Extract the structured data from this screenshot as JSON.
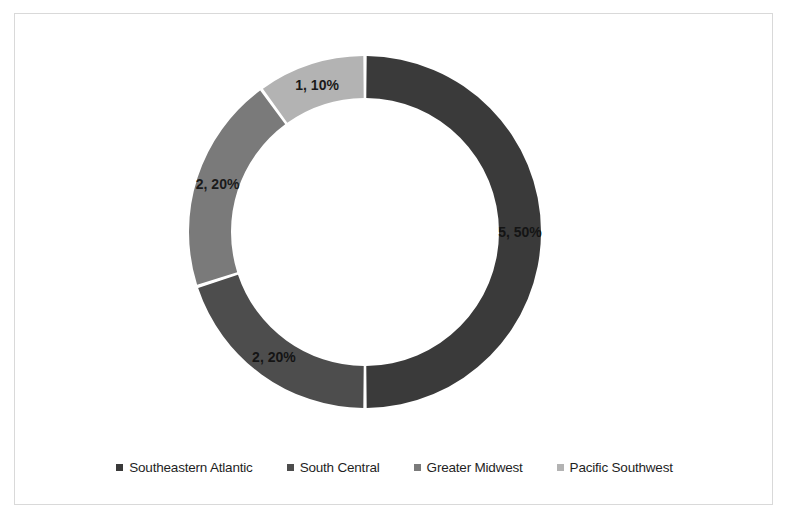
{
  "chart_data": {
    "type": "pie",
    "variant": "doughnut",
    "title": "",
    "subtitle": "",
    "xlabel": "",
    "ylabel": "",
    "grid": false,
    "legend_position": "bottom",
    "start_angle_deg": 0,
    "direction": "clockwise",
    "total_value": 10,
    "categories": [
      "Southeastern Atlantic",
      "South Central",
      "Greater Midwest",
      "Pacific Southwest"
    ],
    "values": [
      5,
      2,
      2,
      1
    ],
    "percentages": [
      50,
      20,
      20,
      10
    ],
    "data_labels": [
      "5, 50%",
      "2, 20%",
      "2, 20%",
      "1, 10%"
    ],
    "colors": [
      "#3a3a3a",
      "#4d4d4d",
      "#7a7a7a",
      "#b3b3b3"
    ],
    "slices": [
      {
        "label": "Southeastern Atlantic",
        "value": 5,
        "percent": 50,
        "data_label": "5, 50%",
        "color": "#3a3a3a"
      },
      {
        "label": "South Central",
        "value": 2,
        "percent": 20,
        "data_label": "2, 20%",
        "color": "#4d4d4d"
      },
      {
        "label": "Greater Midwest",
        "value": 2,
        "percent": 20,
        "data_label": "2, 20%",
        "color": "#7a7a7a"
      },
      {
        "label": "Pacific Southwest",
        "value": 1,
        "percent": 10,
        "data_label": "1, 10%",
        "color": "#b3b3b3"
      }
    ]
  },
  "legend": {
    "items": [
      {
        "label": "Southeastern Atlantic",
        "color": "#3a3a3a"
      },
      {
        "label": "South Central",
        "color": "#4d4d4d"
      },
      {
        "label": "Greater Midwest",
        "color": "#7a7a7a"
      },
      {
        "label": "Pacific Southwest",
        "color": "#b3b3b3"
      }
    ]
  },
  "style": {
    "frame_border_color": "#d9d9d9",
    "background": "#ffffff",
    "label_text_color": "#1a1a1a",
    "slice_gap_color": "#ffffff"
  }
}
